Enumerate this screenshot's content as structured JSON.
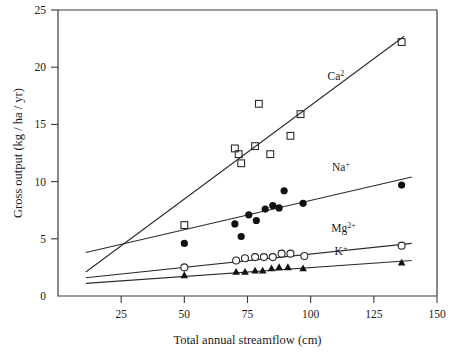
{
  "chart_data": {
    "type": "scatter",
    "title": "",
    "xlabel": "Total annual streamflow (cm)",
    "ylabel": "Gross output (kg / ha / yr)",
    "xlim": [
      0,
      150
    ],
    "ylim": [
      0,
      25
    ],
    "xticks": [
      25,
      50,
      75,
      100,
      125,
      150
    ],
    "yticks": [
      0,
      5,
      10,
      15,
      20,
      25
    ],
    "grid": false,
    "legend_position": "inline-annotations",
    "series": [
      {
        "name": "Ca2",
        "label": "Ca",
        "superscript": "2",
        "marker": "open-square",
        "label_x": 110,
        "label_y": 18.9,
        "trend": {
          "x1": 11,
          "y1": 2.1,
          "x2": 137,
          "y2": 22.7
        },
        "points": [
          {
            "x": 50.0,
            "y": 6.2
          },
          {
            "x": 70.0,
            "y": 12.9
          },
          {
            "x": 71.5,
            "y": 12.4
          },
          {
            "x": 72.5,
            "y": 11.6
          },
          {
            "x": 78.0,
            "y": 13.1
          },
          {
            "x": 79.5,
            "y": 16.8
          },
          {
            "x": 84.0,
            "y": 12.4
          },
          {
            "x": 92.0,
            "y": 14.0
          },
          {
            "x": 96.0,
            "y": 15.9
          },
          {
            "x": 136.0,
            "y": 22.2
          }
        ]
      },
      {
        "name": "Na+",
        "label": "Na",
        "superscript": "+",
        "marker": "filled-circle",
        "label_x": 112,
        "label_y": 10.9,
        "trend": {
          "x1": 11,
          "y1": 3.8,
          "x2": 140,
          "y2": 10.4
        },
        "points": [
          {
            "x": 50.0,
            "y": 4.6
          },
          {
            "x": 70.0,
            "y": 6.3
          },
          {
            "x": 72.5,
            "y": 5.2
          },
          {
            "x": 75.5,
            "y": 7.1
          },
          {
            "x": 78.5,
            "y": 6.6
          },
          {
            "x": 82.0,
            "y": 7.6
          },
          {
            "x": 85.0,
            "y": 7.9
          },
          {
            "x": 87.5,
            "y": 7.7
          },
          {
            "x": 89.5,
            "y": 9.2
          },
          {
            "x": 97.0,
            "y": 8.1
          },
          {
            "x": 136.0,
            "y": 9.7
          }
        ]
      },
      {
        "name": "Mg2+",
        "label": "Mg",
        "superscript": "2+",
        "marker": "open-circle",
        "label_x": 113,
        "label_y": 5.6,
        "trend": {
          "x1": 11,
          "y1": 1.6,
          "x2": 140,
          "y2": 4.6
        },
        "points": [
          {
            "x": 50.0,
            "y": 2.5
          },
          {
            "x": 70.5,
            "y": 3.1
          },
          {
            "x": 74.0,
            "y": 3.3
          },
          {
            "x": 78.0,
            "y": 3.4
          },
          {
            "x": 81.5,
            "y": 3.4
          },
          {
            "x": 85.0,
            "y": 3.4
          },
          {
            "x": 88.5,
            "y": 3.7
          },
          {
            "x": 92.0,
            "y": 3.7
          },
          {
            "x": 97.5,
            "y": 3.5
          },
          {
            "x": 136.0,
            "y": 4.4
          }
        ]
      },
      {
        "name": "K+",
        "label": "K",
        "superscript": "+",
        "marker": "filled-triangle",
        "label_x": 112,
        "label_y": 3.6,
        "trend": {
          "x1": 11,
          "y1": 1.1,
          "x2": 140,
          "y2": 3.1
        },
        "points": [
          {
            "x": 50.0,
            "y": 1.8
          },
          {
            "x": 70.5,
            "y": 2.1
          },
          {
            "x": 74.0,
            "y": 2.1
          },
          {
            "x": 78.0,
            "y": 2.2
          },
          {
            "x": 81.0,
            "y": 2.2
          },
          {
            "x": 84.5,
            "y": 2.4
          },
          {
            "x": 87.5,
            "y": 2.5
          },
          {
            "x": 91.0,
            "y": 2.5
          },
          {
            "x": 97.0,
            "y": 2.4
          },
          {
            "x": 136.0,
            "y": 2.9
          }
        ]
      }
    ]
  },
  "axes": {
    "x_title": "Total annual streamflow (cm)",
    "y_title": "Gross output (kg / ha / yr)",
    "x_tick_labels": [
      "25",
      "50",
      "75",
      "100",
      "125",
      "150"
    ],
    "y_tick_labels": [
      "0",
      "5",
      "10",
      "15",
      "20",
      "25"
    ]
  },
  "colors": {
    "axis": "#3a3a3a",
    "marker": "#111111",
    "trend": "#2b2b2b",
    "background": "#ffffff"
  }
}
